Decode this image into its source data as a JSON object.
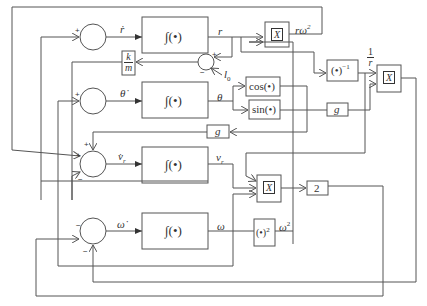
{
  "diagram": {
    "type": "block-diagram",
    "summing_junctions": [
      {
        "id": "sum-r",
        "signs": [
          "+"
        ]
      },
      {
        "id": "sum-theta",
        "signs": [
          "+"
        ]
      },
      {
        "id": "sum-vr",
        "signs": [
          "+",
          "+",
          "-"
        ]
      },
      {
        "id": "sum-omega",
        "signs": [
          "-",
          "-"
        ]
      },
      {
        "id": "sum-l0",
        "signs": [
          "+",
          "-"
        ]
      }
    ],
    "integrators": [
      {
        "id": "int-r",
        "label": "∫(•)",
        "input": "ṙ",
        "output": "r"
      },
      {
        "id": "int-theta",
        "label": "∫(•)",
        "input": "θ̇",
        "output": "θ"
      },
      {
        "id": "int-vr",
        "label": "∫(•)",
        "input": "v̇r",
        "output": "vr"
      },
      {
        "id": "int-omega",
        "label": "∫(•)",
        "input": "ω̇",
        "output": "ω"
      }
    ],
    "blocks": {
      "k_over_m_num": "k",
      "k_over_m_den": "m",
      "cos": "cos(•)",
      "sin": "sin(•)",
      "g1": "g",
      "g2": "g",
      "inverse": "(•)",
      "inverse_exp": "−1",
      "square": "(•)",
      "square_exp": "2",
      "gain2": "2",
      "mult": "X"
    },
    "signals": {
      "r_dot": "ṙ",
      "r": "r",
      "r_omega2": "rω",
      "r_omega2_exp": "2",
      "l0": "l",
      "l0_sub": "0",
      "theta_dot": "θ̇",
      "theta": "θ",
      "vr_dot": "v̇",
      "vr_dot_sub": "r",
      "vr": "v",
      "vr_sub": "r",
      "omega_dot": "ω̇",
      "omega": "ω",
      "omega2": "ω",
      "omega2_exp": "2",
      "one": "1",
      "one_over_r_den": "r"
    },
    "signs": {
      "plus": "+",
      "minus": "−",
      "plusplus": "+"
    }
  }
}
